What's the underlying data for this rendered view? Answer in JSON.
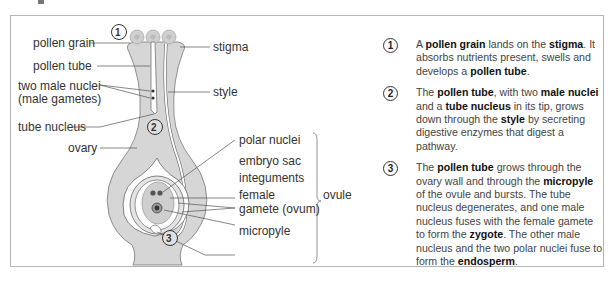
{
  "figure": {
    "labels": {
      "pollen_grain": "pollen grain",
      "pollen_tube": "pollen tube",
      "two_male_nuclei": "two male nuclei",
      "male_gametes": "(male gametes)",
      "tube_nucleus": "tube nucleus",
      "ovary": "ovary",
      "stigma": "stigma",
      "style": "style",
      "polar_nuclei": "polar nuclei",
      "embryo_sac": "embryo sac",
      "integuments": "integuments",
      "female": "female",
      "gamete_ovum": "gamete (ovum)",
      "micropyle": "micropyle",
      "ovule": "ovule"
    },
    "markers": [
      "1",
      "2",
      "3"
    ],
    "colors": {
      "tissue": "#d3d3d3",
      "tissue_dark": "#bdbdbd",
      "outline": "#666666",
      "frame": "#b5b5b5"
    }
  },
  "steps": [
    {
      "num": "1",
      "parts": [
        {
          "t": "A ",
          "b": false
        },
        {
          "t": "pollen grain",
          "b": true
        },
        {
          "t": " lands on the ",
          "b": false
        },
        {
          "t": "stigma",
          "b": true
        },
        {
          "t": ". It absorbs nutrients present, swells and develops a ",
          "b": false
        },
        {
          "t": "pollen tube",
          "b": true
        },
        {
          "t": ".",
          "b": false
        }
      ]
    },
    {
      "num": "2",
      "parts": [
        {
          "t": "The ",
          "b": false
        },
        {
          "t": "pollen tube",
          "b": true
        },
        {
          "t": ", with two ",
          "b": false
        },
        {
          "t": "male nuclei",
          "b": true
        },
        {
          "t": " and a ",
          "b": false
        },
        {
          "t": "tube nucleus",
          "b": true
        },
        {
          "t": " in its tip, grows down through the ",
          "b": false
        },
        {
          "t": "style",
          "b": true
        },
        {
          "t": " by secreting digestive enzymes that digest a pathway.",
          "b": false
        }
      ]
    },
    {
      "num": "3",
      "parts": [
        {
          "t": "The ",
          "b": false
        },
        {
          "t": "pollen tube",
          "b": true
        },
        {
          "t": " grows through the ovary wall and through the ",
          "b": false
        },
        {
          "t": "micropyle",
          "b": true
        },
        {
          "t": " of the ovule and bursts. The tube nucleus degenerates, and one male nucleus fuses with the female gamete to form the ",
          "b": false
        },
        {
          "t": "zygote",
          "b": true
        },
        {
          "t": ". The other male nucleus and the two polar nuclei fuse to form the ",
          "b": false
        },
        {
          "t": "endosperm",
          "b": true
        },
        {
          "t": ".",
          "b": false
        }
      ]
    }
  ]
}
